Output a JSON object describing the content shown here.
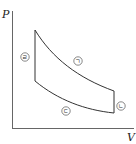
{
  "diagram": {
    "type": "PV-cycle",
    "axes": {
      "y_label": "P",
      "x_label": "V"
    },
    "processes": [
      {
        "id": "ㄱ",
        "label": "ㄱ",
        "description": "curved expansion from upper-left to right (pressure decreasing)"
      },
      {
        "id": "ㄴ",
        "label": "ㄴ",
        "description": "vertical line at right (constant volume)"
      },
      {
        "id": "ㄷ",
        "label": "ㄷ",
        "description": "curved line at bottom between right and left"
      },
      {
        "id": "ㄹ",
        "label": "ㄹ",
        "description": "vertical line at left (constant volume)"
      }
    ],
    "colors": {
      "line": "#333333",
      "axis": "#555555",
      "background": "#ffffff"
    }
  }
}
